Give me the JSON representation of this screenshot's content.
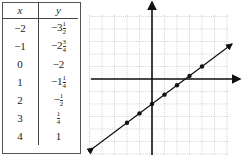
{
  "table": {
    "headers": [
      "x",
      "y"
    ],
    "rows": [
      {
        "x": "−2",
        "y_whole": "−3",
        "y_num": "1",
        "y_den": "2"
      },
      {
        "x": "−1",
        "y_whole": "−2",
        "y_num": "3",
        "y_den": "4"
      },
      {
        "x": "0",
        "y_whole": "−2",
        "y_num": "",
        "y_den": ""
      },
      {
        "x": "1",
        "y_whole": "−1",
        "y_num": "1",
        "y_den": "4"
      },
      {
        "x": "2",
        "y_whole": "−",
        "y_num": "1",
        "y_den": "2"
      },
      {
        "x": "3",
        "y_whole": "",
        "y_num": "1",
        "y_den": "4"
      },
      {
        "x": "4",
        "y_whole": "1",
        "y_num": "",
        "y_den": ""
      }
    ]
  },
  "graph": {
    "points": [
      {
        "x": -2,
        "y": -3.5
      },
      {
        "x": -1,
        "y": -2.75
      },
      {
        "x": 0,
        "y": -2
      },
      {
        "x": 1,
        "y": -1.25
      },
      {
        "x": 2,
        "y": -0.5
      },
      {
        "x": 3,
        "y": 0.25
      },
      {
        "x": 4,
        "y": 1
      }
    ],
    "line": "y = 3/4 x - 2",
    "colors": {
      "axis": "#111111",
      "grid": "#b0b0b0",
      "line": "#111111"
    }
  }
}
